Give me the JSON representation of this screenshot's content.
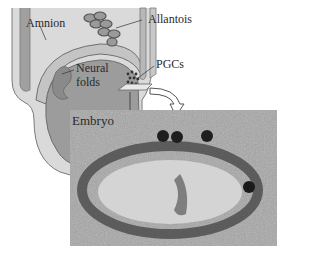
{
  "figure": {
    "type": "embryo-diagram-with-micrograph",
    "labels": {
      "amnion": "Amnion",
      "allantois": "Allantois",
      "neural_folds_line1": "Neural",
      "neural_folds_line2": "folds",
      "pgcs": "PGCs",
      "embryo": "Embryo"
    },
    "colors": {
      "embryo_fill": "#9c9c9c",
      "amnion_fill": "#c8c8c8",
      "outline": "#6e6e6e",
      "background": "#ffffff"
    }
  }
}
